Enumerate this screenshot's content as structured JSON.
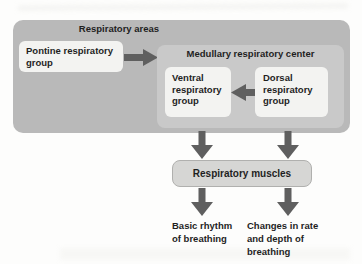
{
  "diagram": {
    "areas_title": "Respiratory areas",
    "pontine": {
      "label": "Pontine respiratory group"
    },
    "medullary": {
      "title": "Medullary respiratory center"
    },
    "ventral": {
      "label": "Ventral respiratory group"
    },
    "dorsal": {
      "label": "Dorsal respiratory group"
    },
    "muscles": {
      "label": "Respiratory muscles"
    },
    "outcomes": [
      {
        "label": "Basic rhythm of breathing"
      },
      {
        "label": "Changes in rate and depth of breathing"
      }
    ],
    "colors": {
      "background": "#fdfdfc",
      "outer_group_fill": "#b9b9b9",
      "medullary_fill": "#c9c9c9",
      "subgroup_fill": "#f3f3f1",
      "muscles_fill": "#d6d6d4",
      "muscles_border": "#b0b0ae",
      "arrow": "#5f5f5f",
      "text": "#1f1f1f"
    }
  }
}
